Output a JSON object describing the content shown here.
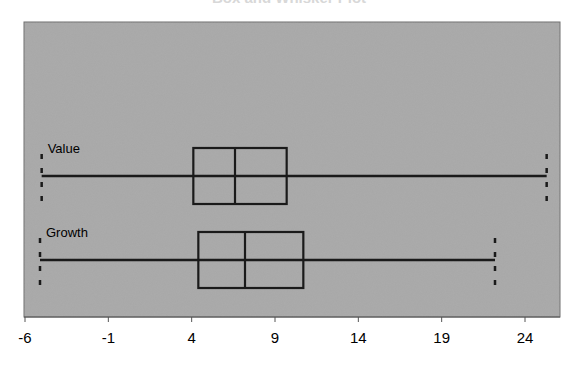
{
  "chart_data": {
    "type": "box",
    "title": "Box and Whisker Plot",
    "orientation": "horizontal",
    "xlabel": "",
    "ylabel": "",
    "xlim": [
      -6,
      26
    ],
    "x_ticks": [
      -6,
      -1,
      4,
      9,
      14,
      19,
      24
    ],
    "x_tick_labels": [
      "-6",
      "-1",
      "4",
      "9",
      "14",
      "19",
      "24"
    ],
    "grid": false,
    "background": "#a9a9a9",
    "series": [
      {
        "name": "Value",
        "min": -5.0,
        "q1": 4.1,
        "median": 6.6,
        "q3": 9.7,
        "max": 25.3
      },
      {
        "name": "Growth",
        "min": -5.1,
        "q1": 4.4,
        "median": 7.2,
        "q3": 10.7,
        "max": 22.2
      }
    ]
  }
}
